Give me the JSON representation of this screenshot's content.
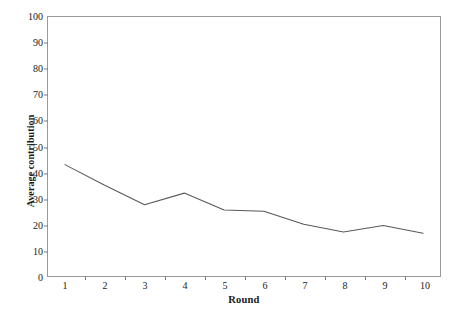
{
  "figure": {
    "background_color": "#ffffff",
    "frame_color": "#9a9a9a",
    "line_color": "#595959"
  },
  "chart_data": {
    "type": "line",
    "title": "",
    "xlabel": "Round",
    "ylabel": "Average contribution",
    "categories": [
      "1",
      "2",
      "3",
      "4",
      "5",
      "6",
      "7",
      "8",
      "9",
      "10"
    ],
    "values": [
      43,
      35,
      27.5,
      32,
      25.5,
      25,
      20,
      17,
      19.5,
      16.5
    ],
    "series": [
      {
        "name": "Average contribution",
        "values": [
          43,
          35,
          27.5,
          32,
          25.5,
          25,
          20,
          17,
          19.5,
          16.5
        ]
      }
    ],
    "ylim": [
      0,
      100
    ],
    "ytick_labels": [
      "0",
      "10",
      "20",
      "30",
      "40",
      "50",
      "60",
      "70",
      "80",
      "90",
      "100"
    ],
    "ytick_values": [
      0,
      10,
      20,
      30,
      40,
      50,
      60,
      70,
      80,
      90,
      100
    ],
    "xtick_labels": [
      "1",
      "2",
      "3",
      "4",
      "5",
      "6",
      "7",
      "8",
      "9",
      "10"
    ],
    "grid": false,
    "legend": false,
    "markers": false
  }
}
